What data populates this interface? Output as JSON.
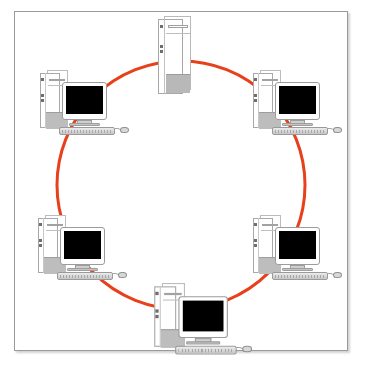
{
  "diagram": {
    "topology_type": "ring",
    "background_color": "#ffffff",
    "frame": {
      "border_color": "#9a9a9a",
      "shadow": true
    },
    "ring": {
      "color": "#E8401A",
      "stroke_width": 3,
      "center_x": 181,
      "center_y": 185,
      "radius": 124,
      "shape": "circle",
      "closed": true
    },
    "nodes": [
      {
        "id": "node-top-server",
        "label": "Server Tower",
        "device_type": "server-tower",
        "has_monitor": false,
        "position": "top",
        "x": 158,
        "y": 16,
        "angle_deg": 90
      },
      {
        "id": "node-top-left",
        "label": "Workstation Top Left",
        "device_type": "desktop-computer",
        "has_monitor": true,
        "position": "top-left",
        "x": 38,
        "y": 70,
        "angle_deg": 150
      },
      {
        "id": "node-top-right",
        "label": "Workstation Top Right",
        "device_type": "desktop-computer",
        "has_monitor": true,
        "position": "top-right",
        "x": 251,
        "y": 70,
        "angle_deg": 30
      },
      {
        "id": "node-bottom-right",
        "label": "Workstation Bottom Right",
        "device_type": "desktop-computer",
        "has_monitor": true,
        "position": "bottom-right",
        "x": 251,
        "y": 215,
        "angle_deg": 330
      },
      {
        "id": "node-bottom-center",
        "label": "Workstation Bottom Center",
        "device_type": "desktop-computer",
        "has_monitor": true,
        "position": "bottom-center",
        "x": 152,
        "y": 283,
        "angle_deg": 270
      },
      {
        "id": "node-bottom-left",
        "label": "Workstation Bottom Left",
        "device_type": "desktop-computer",
        "has_monitor": true,
        "position": "bottom-left",
        "x": 36,
        "y": 215,
        "angle_deg": 210
      }
    ],
    "node_count": 6,
    "connection_count": 6,
    "screen_color": "#000000",
    "chassis_color": "#ffffff",
    "chassis_outline": "#a8a8a8",
    "base_color": "#bdbdbd"
  }
}
